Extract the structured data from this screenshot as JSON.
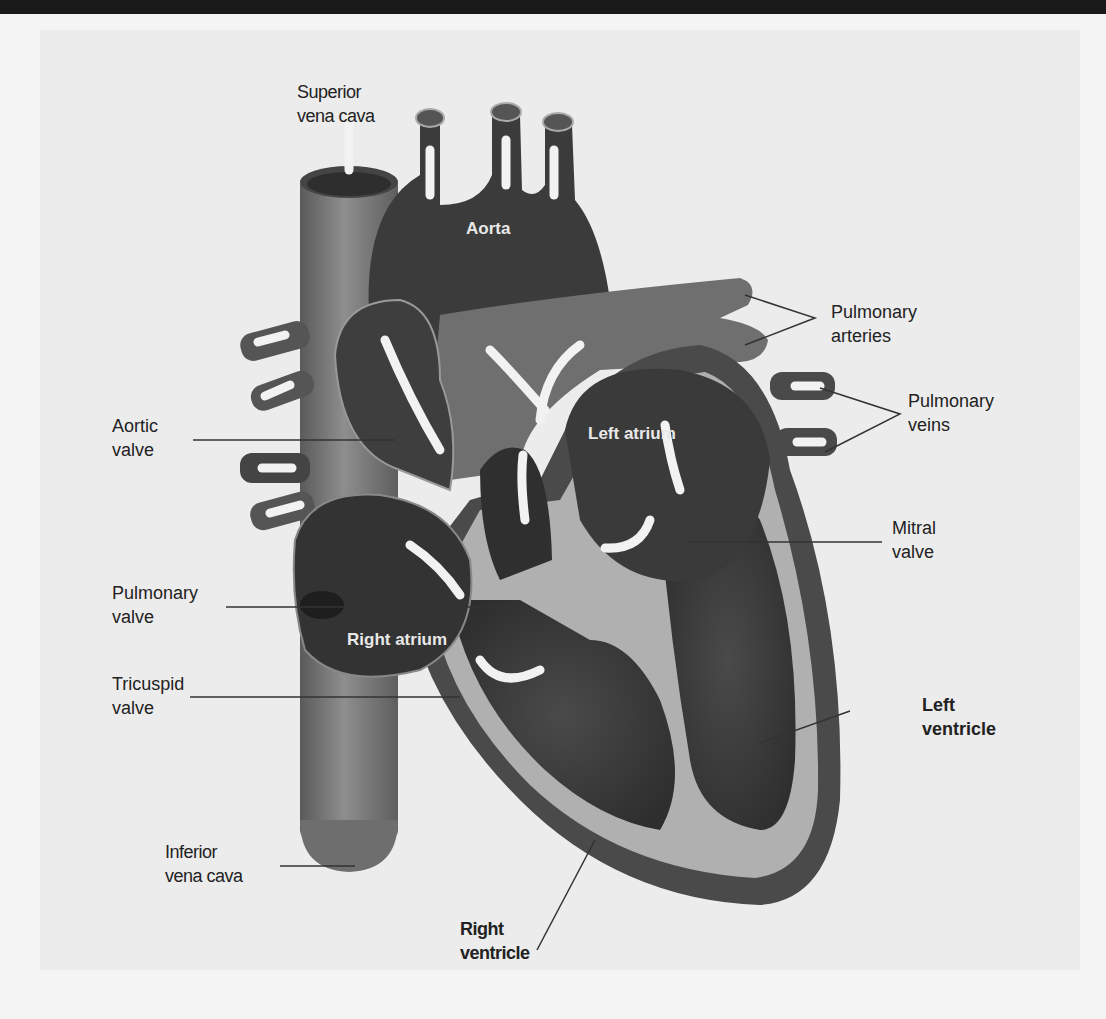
{
  "diagram": {
    "colors": {
      "background": "#f4f4f4",
      "heart_dark": "#3a3a3a",
      "heart_mid": "#6a6a6a",
      "vessel": "#7c7c7c",
      "wall_light": "#b4b4b4",
      "arrow": "#f2f2f2",
      "label_text": "#222222"
    },
    "labels": {
      "superior_vena_cava": [
        "Superior",
        "vena cava"
      ],
      "aorta": "Aorta",
      "pulmonary_arteries": [
        "Pulmonary",
        "arteries"
      ],
      "pulmonary_veins": [
        "Pulmonary",
        "veins"
      ],
      "aortic_valve": [
        "Aortic",
        "valve"
      ],
      "left_atrium": "Left atrium",
      "mitral_valve": [
        "Mitral",
        "valve"
      ],
      "pulmonary_valve": [
        "Pulmonary",
        "valve"
      ],
      "right_atrium": "Right atrium",
      "tricuspid_valve": [
        "Tricuspid",
        "valve"
      ],
      "left_ventricle": [
        "Left",
        "ventricle"
      ],
      "inferior_vena_cava": [
        "Inferior",
        "vena cava"
      ],
      "right_ventricle": [
        "Right",
        "ventricle"
      ]
    }
  }
}
